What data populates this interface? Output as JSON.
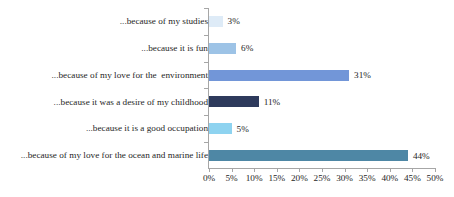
{
  "chart_data": {
    "type": "bar",
    "orientation": "horizontal",
    "title": "",
    "subtitle": "",
    "xlabel": "",
    "ylabel": "",
    "xlim": [
      0,
      50
    ],
    "xtick_step": 5,
    "grid": false,
    "legend": "none",
    "value_suffix": "%",
    "categories": [
      "...because of my studies",
      "...because it is fun",
      "...because of my love for the  environment",
      "...because it was a desire of my childhood",
      "...because it is a good occupation",
      "...because of my love for the ocean and marine life"
    ],
    "values": [
      3,
      6,
      31,
      11,
      5,
      44
    ],
    "value_labels": [
      "3%",
      "6%",
      "31%",
      "11%",
      "5%",
      "44%"
    ],
    "bar_colors": [
      "#DEEBF7",
      "#9DC3E6",
      "#7296D8",
      "#2E3A5C",
      "#8ED3F0",
      "#4E87A5"
    ],
    "xtick_labels": [
      "0%",
      "5%",
      "10%",
      "15%",
      "20%",
      "25%",
      "30%",
      "35%",
      "40%",
      "45%",
      "50%"
    ],
    "xtick_values": [
      0,
      5,
      10,
      15,
      20,
      25,
      30,
      35,
      40,
      45,
      50
    ]
  },
  "axis": {
    "color": "#a6a6a6"
  }
}
